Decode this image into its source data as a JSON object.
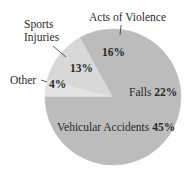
{
  "chart_data": {
    "type": "pie",
    "title": "",
    "center": [
      113,
      97
    ],
    "radius": 68,
    "start_angle_deg": 180,
    "direction": "counterclockwise-on-screen-upward-from-left",
    "slices": [
      {
        "name": "Other",
        "value": 4,
        "pct_label": "4%",
        "color": "#e4e4e4"
      },
      {
        "name": "Sports Injuries",
        "value": 13,
        "pct_label": "13%",
        "color": "#d8d8d8"
      },
      {
        "name": "Acts of Violence",
        "value": 16,
        "pct_label": "16%",
        "color": "#bcbcbc"
      },
      {
        "name": "Falls",
        "value": 22,
        "pct_label": "22%",
        "color": "#bcbcbc"
      },
      {
        "name": "Vehicular Accidents",
        "value": 45,
        "pct_label": "45%",
        "color": "#bcbcbc"
      }
    ],
    "labels": {
      "violence": {
        "text": "Acts of Violence",
        "pct": "16%"
      },
      "sports_line1": "Sports",
      "sports_line2": "Injuries",
      "sports_pct": "13%",
      "other": {
        "text": "Other",
        "pct": "4%"
      },
      "falls": {
        "text": "Falls ",
        "pct": "22%"
      },
      "vehicular": {
        "text": "Vehicular Accidents ",
        "pct": "45%"
      }
    }
  }
}
